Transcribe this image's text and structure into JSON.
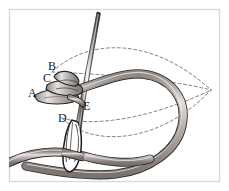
{
  "figure": {
    "background_color": "#ffffff",
    "border_color": "#d9d9d9",
    "border": {
      "x": 9,
      "y": 9,
      "width": 211,
      "height": 173
    }
  },
  "labels": [
    {
      "id": "A",
      "text": "A",
      "x": 28,
      "y": 97
    },
    {
      "id": "B",
      "text": "B",
      "x": 48,
      "y": 70
    },
    {
      "id": "C",
      "text": "C",
      "x": 43,
      "y": 82
    },
    {
      "id": "D",
      "text": "D",
      "x": 58,
      "y": 122
    },
    {
      "id": "E",
      "text": "E",
      "x": 83,
      "y": 110
    }
  ],
  "colors": {
    "thread_fill": "#b9b2ae",
    "thread_fill_light": "#d7d2cf",
    "thread_outline": "#2b2b2b",
    "needle_body": "#6d6d6d",
    "needle_dark": "#1c1c1c",
    "needle_highlight": "#f2f2f2",
    "dashed_guide": "#6a6a6a",
    "label_color": "#1a1a1a"
  },
  "guides": {
    "style": "dashed",
    "dash_pattern": "3,2.5",
    "convergence_point": {
      "x": 211,
      "y": 90
    },
    "curves": [
      {
        "name": "upper-outer-arc",
        "d": "M 52 72 C 88 40, 150 38, 211 90"
      },
      {
        "name": "upper-inner-arc",
        "d": "M 52 72 C 100 76, 165 80, 211 90"
      },
      {
        "name": "lower-inner-arc",
        "d": "M 62 118 C 100 128, 168 108, 211 90"
      },
      {
        "name": "lower-outer-arc",
        "d": "M 62 118 C 90 146, 158 142, 211 90"
      }
    ]
  },
  "needle": {
    "name": "sewing-needle",
    "tip": {
      "x": 97,
      "y": 12
    },
    "eye": {
      "x": 73,
      "y": 150,
      "rx": 5,
      "ry": 16
    },
    "angle_degrees": 9
  },
  "thread": {
    "name": "embroidery-thread",
    "loop_description": "large loop curving right and down, passing under needle eye and exiting left"
  }
}
